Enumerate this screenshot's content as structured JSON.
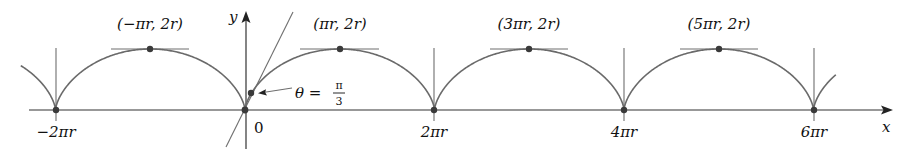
{
  "figure": {
    "type": "cycloid",
    "equation": "x = r(t - sin t), y = r(1 - cos t)",
    "colors": {
      "curve": "#6a6a6a",
      "axis": "#333333",
      "dot": "#3a3a3a",
      "text": "#111111"
    },
    "axes": {
      "x_label": "x",
      "y_label": "y",
      "origin_label": "0"
    },
    "cusps": [
      {
        "label": "−2πr",
        "value": "-2πr"
      },
      {
        "label": "0",
        "value": "0"
      },
      {
        "label": "2πr",
        "value": "2πr"
      },
      {
        "label": "4πr",
        "value": "4πr"
      },
      {
        "label": "6πr",
        "value": "6πr"
      }
    ],
    "peaks": [
      {
        "label": "(−πr, 2r)"
      },
      {
        "label": "(πr, 2r)"
      },
      {
        "label": "(3πr, 2r)"
      },
      {
        "label": "(5πr, 2r)"
      }
    ],
    "annotation": {
      "theta_symbol": "θ =",
      "fraction_numerator": "π",
      "fraction_denominator": "3",
      "text": "θ = π/3"
    }
  }
}
